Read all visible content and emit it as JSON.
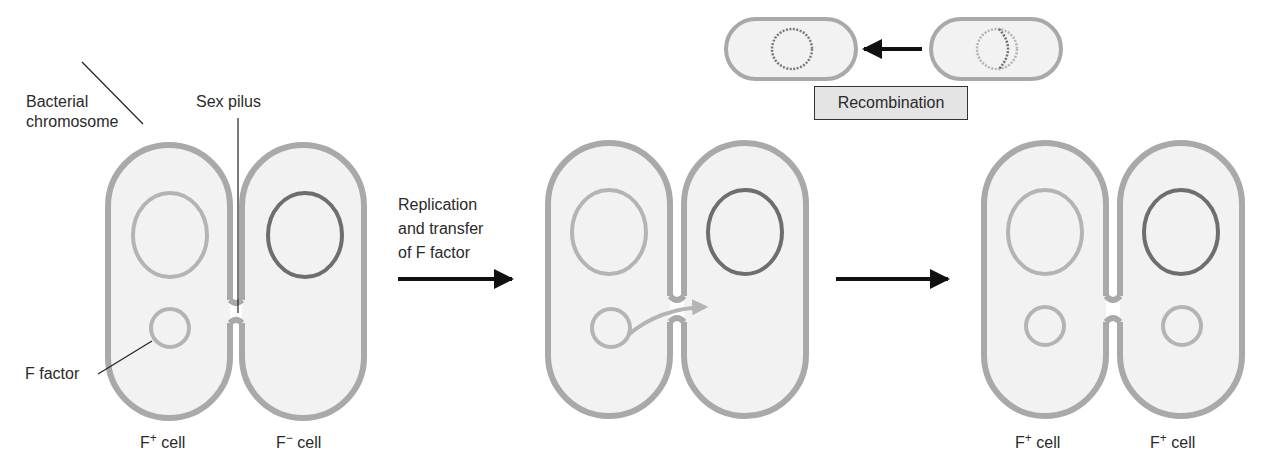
{
  "labels": {
    "bacterial_chromosome_line1": "Bacterial",
    "bacterial_chromosome_line2": "chromosome",
    "sex_pilus": "Sex pilus",
    "f_factor": "F factor",
    "step1_line1": "Replication",
    "step1_line2": "and transfer",
    "step1_line3": "of F factor",
    "recombination": "Recombination"
  },
  "cells": {
    "stage1_left": {
      "prefix": "F",
      "sup": "+",
      "suffix": " cell"
    },
    "stage1_right": {
      "prefix": "F",
      "sup": "−",
      "suffix": " cell"
    },
    "stage3_left": {
      "prefix": "F",
      "sup": "+",
      "suffix": " cell"
    },
    "stage3_right": {
      "prefix": "F",
      "sup": "+",
      "suffix": " cell"
    }
  },
  "colors": {
    "cell_wall": "#a9a9a9",
    "cytoplasm": "#f2f2f2",
    "donor_dna": "#b4b4b4",
    "recipient_dna": "#6e6e6e",
    "arrow": "#111111",
    "box_fill": "#e4e4e4"
  }
}
